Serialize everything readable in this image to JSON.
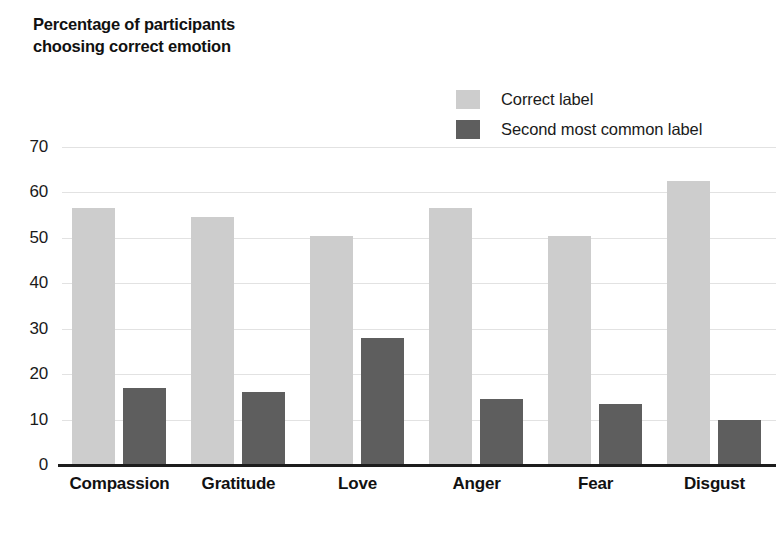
{
  "chart_data": {
    "type": "bar",
    "title": "Percentage of participants choosing correct emotion",
    "ylabel": "Percentage of participants choosing correct emotion",
    "xlabel": "",
    "categories": [
      "Compassion",
      "Gratitude",
      "Love",
      "Anger",
      "Fear",
      "Disgust"
    ],
    "series": [
      {
        "name": "Correct label",
        "color": "#cdcdcd",
        "values": [
          56.5,
          54.5,
          50.5,
          56.5,
          50.5,
          62.5
        ]
      },
      {
        "name": "Second most common label",
        "color": "#5e5e5e",
        "values": [
          17,
          16,
          28,
          14.5,
          13.5,
          10
        ]
      }
    ],
    "ylim": [
      0,
      70
    ],
    "yticks": [
      "0",
      "10",
      "20",
      "30",
      "40",
      "50",
      "60",
      "70"
    ],
    "grid": true,
    "legend_position": "top-right"
  },
  "legend": {
    "items": [
      {
        "label": "Correct label",
        "color": "#cdcdcd",
        "swatch_name": "legend-swatch-correct-label"
      },
      {
        "label": "Second most common label",
        "color": "#5e5e5e",
        "swatch_name": "legend-swatch-second-most-common-label"
      }
    ]
  },
  "colors": {
    "series_light": "#cdcdcd",
    "series_dark": "#5e5e5e",
    "gridline": "#e2e2e2",
    "axis": "#1d1d1d",
    "text": "#1a1a1a",
    "background": "#ffffff"
  }
}
